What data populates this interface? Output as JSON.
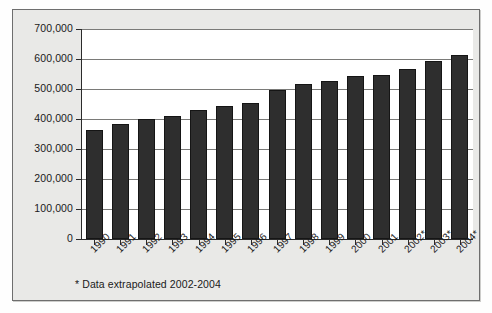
{
  "chart_data": {
    "type": "bar",
    "title": "",
    "subtitle": "",
    "xlabel": "",
    "ylabel": "",
    "categories": [
      "1990",
      "1991",
      "1992",
      "1993",
      "1994",
      "1995",
      "1996",
      "1997",
      "1998",
      "1999",
      "2000",
      "2001",
      "2002*",
      "2003*",
      "2004*"
    ],
    "values": [
      365000,
      382000,
      400000,
      410000,
      430000,
      445000,
      455000,
      498000,
      518000,
      528000,
      542000,
      548000,
      568000,
      595000,
      615000
    ],
    "ylim": [
      0,
      700000
    ],
    "ytick_values": [
      0,
      100000,
      200000,
      300000,
      400000,
      500000,
      600000,
      700000
    ],
    "ytick_labels": [
      "0",
      "100,000",
      "200,000",
      "300,000",
      "400,000",
      "500,000",
      "600,000",
      "700,000"
    ],
    "grid": true,
    "legend": null,
    "legend_position": "none",
    "annotations": [
      "* Data extrapolated 2002-2004"
    ],
    "bar_color": "#2e2e2e",
    "plot_background": "#ffffff",
    "panel_background": "#e9e9e7",
    "axis_color": "#2b2b2b",
    "gridline_color": "#7a7a78"
  },
  "footnote": {
    "text": "* Data extrapolated 2002-2004"
  }
}
